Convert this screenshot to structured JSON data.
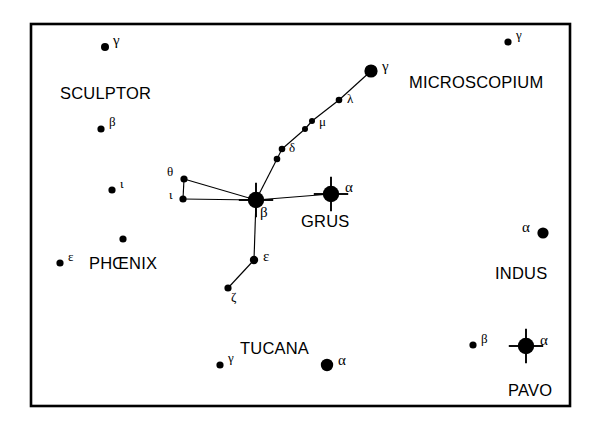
{
  "figure": {
    "type": "star-chart",
    "background_color": "#ffffff",
    "ink_color": "#000000",
    "frame": {
      "x": 31,
      "y": 24,
      "width": 539,
      "height": 382,
      "stroke_width": 2.6
    }
  },
  "constellation_labels": [
    {
      "name": "SCULPTOR",
      "x": 60,
      "y": 85,
      "font_size": 16.5
    },
    {
      "name": "MICROSCOPIUM",
      "x": 409,
      "y": 74,
      "font_size": 16.5
    },
    {
      "name": "GRUS",
      "x": 301,
      "y": 213,
      "font_size": 16.5
    },
    {
      "name": "PHŒNIX",
      "x": 89,
      "y": 255,
      "font_size": 16.5
    },
    {
      "name": "INDUS",
      "x": 495,
      "y": 265,
      "font_size": 16.5
    },
    {
      "name": "TUCANA",
      "x": 240,
      "y": 340,
      "font_size": 16.5
    },
    {
      "name": "PAVO",
      "x": 508,
      "y": 382,
      "font_size": 16.5
    }
  ],
  "stars": [
    {
      "id": "scl-gamma",
      "constellation": "Sculptor",
      "bayer": "γ",
      "x": 105,
      "y": 47,
      "r": 4.0,
      "spikes": false,
      "label_dx": 8,
      "label_dy": -6
    },
    {
      "id": "scl-beta",
      "constellation": "Sculptor",
      "bayer": "β",
      "x": 101,
      "y": 129,
      "r": 3.6,
      "spikes": false,
      "label_dx": 8,
      "label_dy": -6
    },
    {
      "id": "scl-iota",
      "constellation": "Sculptor",
      "bayer": "ι",
      "x": 112,
      "y": 190,
      "r": 3.6,
      "spikes": false,
      "label_dx": 8,
      "label_dy": -5
    },
    {
      "id": "phe-epsilon",
      "constellation": "Phoenix",
      "bayer": "ε",
      "x": 60,
      "y": 263,
      "r": 3.6,
      "spikes": false,
      "label_dx": 8,
      "label_dy": -5
    },
    {
      "id": "phe-unlab",
      "constellation": "Phoenix",
      "bayer": "",
      "x": 123,
      "y": 239,
      "r": 3.6,
      "spikes": false,
      "label_dx": 0,
      "label_dy": 0
    },
    {
      "id": "gru-theta",
      "constellation": "Grus",
      "bayer": "θ",
      "x": 184,
      "y": 179,
      "r": 3.6,
      "spikes": false,
      "label_dx": -17,
      "label_dy": -6
    },
    {
      "id": "gru-iota",
      "constellation": "Grus",
      "bayer": "ι",
      "x": 183,
      "y": 199,
      "r": 3.6,
      "spikes": false,
      "label_dx": -14,
      "label_dy": -3
    },
    {
      "id": "gru-beta",
      "constellation": "Grus",
      "bayer": "β",
      "x": 256,
      "y": 200,
      "r": 8.2,
      "spikes": true,
      "label_dx": 4,
      "label_dy": 13
    },
    {
      "id": "gru-alpha",
      "constellation": "Grus",
      "bayer": "α",
      "x": 331,
      "y": 194,
      "r": 8.2,
      "spikes": true,
      "label_dx": 14,
      "label_dy": -6
    },
    {
      "id": "gru-delta1",
      "constellation": "Grus",
      "bayer": "",
      "x": 277,
      "y": 159,
      "r": 3.3,
      "spikes": false,
      "label_dx": 0,
      "label_dy": 0
    },
    {
      "id": "gru-delta2",
      "constellation": "Grus",
      "bayer": "δ",
      "x": 282,
      "y": 149,
      "r": 3.3,
      "spikes": false,
      "label_dx": 7,
      "label_dy": 0
    },
    {
      "id": "gru-mu1",
      "constellation": "Grus",
      "bayer": "",
      "x": 305,
      "y": 129,
      "r": 3.0,
      "spikes": false,
      "label_dx": 0,
      "label_dy": 0
    },
    {
      "id": "gru-mu2",
      "constellation": "Grus",
      "bayer": "μ",
      "x": 312,
      "y": 121,
      "r": 3.0,
      "spikes": false,
      "label_dx": 7,
      "label_dy": 2
    },
    {
      "id": "gru-lambda",
      "constellation": "Grus",
      "bayer": "λ",
      "x": 339,
      "y": 100,
      "r": 3.3,
      "spikes": false,
      "label_dx": 8,
      "label_dy": 0
    },
    {
      "id": "gru-gamma",
      "constellation": "Grus",
      "bayer": "γ",
      "x": 371,
      "y": 71,
      "r": 6.6,
      "spikes": false,
      "label_dx": 11,
      "label_dy": -4
    },
    {
      "id": "gru-epsilon",
      "constellation": "Grus",
      "bayer": "ε",
      "x": 254,
      "y": 260,
      "r": 4.2,
      "spikes": false,
      "label_dx": 9,
      "label_dy": -3
    },
    {
      "id": "gru-zeta",
      "constellation": "Grus",
      "bayer": "ζ",
      "x": 228,
      "y": 288,
      "r": 3.6,
      "spikes": false,
      "label_dx": 3,
      "label_dy": 10
    },
    {
      "id": "mic-gamma",
      "constellation": "Microscopium",
      "bayer": "γ",
      "x": 508,
      "y": 42,
      "r": 3.6,
      "spikes": false,
      "label_dx": 8,
      "label_dy": -6
    },
    {
      "id": "ind-alpha",
      "constellation": "Indus",
      "bayer": "α",
      "x": 543,
      "y": 233,
      "r": 5.6,
      "spikes": false,
      "label_dx": -21,
      "label_dy": -5
    },
    {
      "id": "pav-beta",
      "constellation": "Pavo",
      "bayer": "β",
      "x": 473,
      "y": 345,
      "r": 3.6,
      "spikes": false,
      "label_dx": 8,
      "label_dy": -5
    },
    {
      "id": "pav-alpha",
      "constellation": "Pavo",
      "bayer": "α",
      "x": 526,
      "y": 346,
      "r": 8.2,
      "spikes": true,
      "label_dx": 14,
      "label_dy": -5
    },
    {
      "id": "tuc-gamma",
      "constellation": "Tucana",
      "bayer": "γ",
      "x": 220,
      "y": 365,
      "r": 3.6,
      "spikes": false,
      "label_dx": 8,
      "label_dy": -6
    },
    {
      "id": "tuc-alpha",
      "constellation": "Tucana",
      "bayer": "α",
      "x": 327,
      "y": 365,
      "r": 6.2,
      "spikes": false,
      "label_dx": 11,
      "label_dy": -4
    }
  ],
  "links": [
    {
      "from": "gru-theta",
      "to": "gru-iota"
    },
    {
      "from": "gru-theta",
      "to": "gru-beta"
    },
    {
      "from": "gru-iota",
      "to": "gru-beta"
    },
    {
      "from": "gru-beta",
      "to": "gru-alpha"
    },
    {
      "from": "gru-beta",
      "to": "gru-delta1"
    },
    {
      "from": "gru-delta1",
      "to": "gru-delta2"
    },
    {
      "from": "gru-delta2",
      "to": "gru-mu1"
    },
    {
      "from": "gru-mu1",
      "to": "gru-mu2"
    },
    {
      "from": "gru-mu2",
      "to": "gru-lambda"
    },
    {
      "from": "gru-lambda",
      "to": "gru-gamma"
    },
    {
      "from": "gru-beta",
      "to": "gru-epsilon"
    },
    {
      "from": "gru-epsilon",
      "to": "gru-zeta"
    }
  ],
  "spike_length": 9
}
